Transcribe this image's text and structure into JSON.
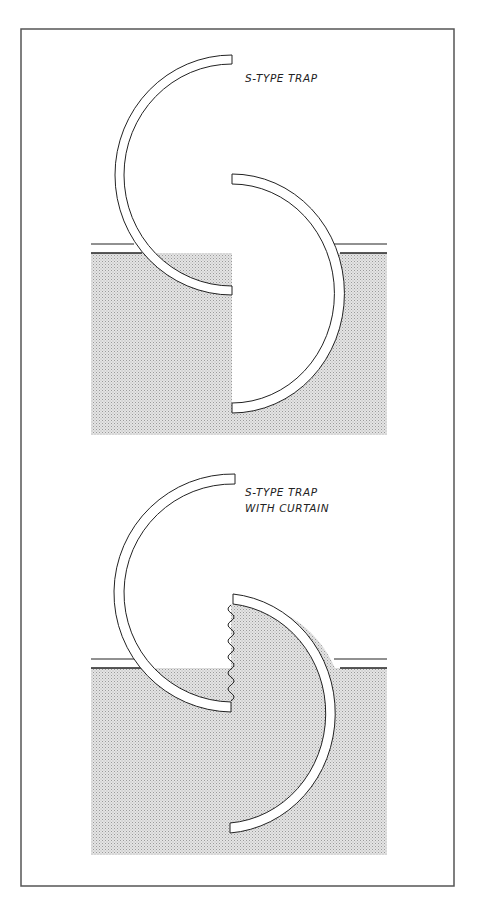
{
  "figure": {
    "frame": {
      "x": 21,
      "y": 29,
      "width": 433,
      "height": 857
    },
    "colors": {
      "line": "#222222",
      "frame": "#555555",
      "soil": "#d0d0d0",
      "background": "#ffffff"
    }
  },
  "panels": [
    {
      "id": "s-type-trap",
      "label_lines": [
        "S-TYPE TRAP"
      ],
      "has_curtain": false
    },
    {
      "id": "s-type-trap-with-curtain",
      "label_lines": [
        "S-TYPE TRAP",
        "WITH CURTAIN"
      ],
      "has_curtain": true
    }
  ]
}
